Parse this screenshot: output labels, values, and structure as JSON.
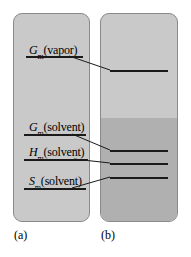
{
  "figure": {
    "type": "energy-level-diagram",
    "background": "#ffffff"
  },
  "panels": [
    {
      "id": "a",
      "caption": "(a)",
      "fill": "#c9c9c9",
      "border": "#8a8a8a",
      "levels": [
        {
          "id": "gm-vapor",
          "symbol": "G",
          "subscript": "m",
          "argument": "(vapor)",
          "label": "Gm(vapor)",
          "y": 55
        },
        {
          "id": "gm-solvent",
          "symbol": "G",
          "subscript": "m",
          "argument": "(solvent)",
          "label": "Gm(solvent)",
          "y": 133
        },
        {
          "id": "hm-solvent",
          "symbol": "H",
          "subscript": "m",
          "argument": "(solvent)",
          "label": "Hm(solvent)",
          "y": 158
        },
        {
          "id": "sm-solvent",
          "symbol": "S",
          "subscript": "m",
          "argument": "(solvent)",
          "label": "Sm(solvent)",
          "y": 187
        }
      ]
    },
    {
      "id": "b",
      "caption": "(b)",
      "fill_upper": "#c9c9c9",
      "fill_lower": "#b0b0b0",
      "border": "#8a8a8a",
      "levels": [
        {
          "id": "b-vapor",
          "y": 70
        },
        {
          "id": "b-gm",
          "y": 150
        },
        {
          "id": "b-hm",
          "y": 163
        },
        {
          "id": "b-sm",
          "y": 177
        }
      ]
    }
  ],
  "leaders": [
    {
      "id": "leader-vapor",
      "from": "gm-vapor",
      "to": "b-vapor"
    },
    {
      "id": "leader-gm",
      "from": "gm-solvent",
      "to": "b-gm"
    },
    {
      "id": "leader-hm",
      "from": "hm-solvent",
      "to": "b-hm"
    },
    {
      "id": "leader-sm",
      "from": "sm-solvent",
      "to": "b-sm"
    }
  ],
  "colors": {
    "line": "#1a1a1a",
    "panel_light": "#c9c9c9",
    "panel_dark": "#b0b0b0",
    "panel_border": "#8a8a8a"
  }
}
